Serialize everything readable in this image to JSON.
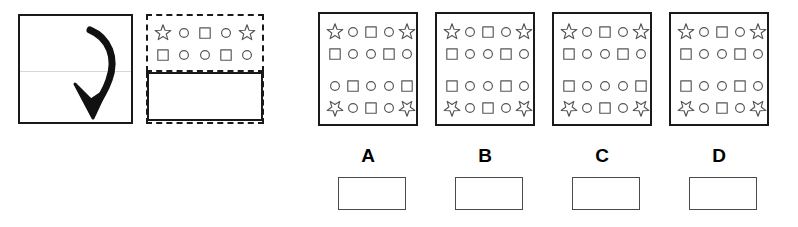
{
  "item": {
    "type": "paper-folding-reasoning-item",
    "shape_glyphs": {
      "star": "star-icon",
      "circle": "circle-icon",
      "square": "square-icon",
      "star_inverted": "star-inverted-icon",
      "blank": "blank-cell"
    }
  },
  "prompt": {
    "panel_1": {
      "name": "unfolded-sheet",
      "has_fold_line": true,
      "arrow": {
        "name": "fold-arrow-icon",
        "direction": "down-curved"
      }
    },
    "panel_2": {
      "name": "folded-sheet",
      "top_half": {
        "border_style": "dashed",
        "rows": [
          [
            "star",
            "circle",
            "square",
            "circle",
            "star"
          ],
          [
            "square",
            "circle",
            "circle",
            "square",
            "circle"
          ]
        ]
      },
      "bottom_half": {
        "border_style": "solid",
        "rows": []
      }
    }
  },
  "options": [
    {
      "label": "A",
      "name": "option-a",
      "rows": [
        [
          "star",
          "circle",
          "square",
          "circle",
          "star"
        ],
        [
          "square",
          "circle",
          "circle",
          "square",
          "circle"
        ],
        [
          "circle",
          "square",
          "circle",
          "circle",
          "square"
        ],
        [
          "star_inverted",
          "circle",
          "square",
          "circle",
          "star_inverted"
        ]
      ]
    },
    {
      "label": "B",
      "name": "option-b",
      "rows": [
        [
          "star",
          "circle",
          "square",
          "circle",
          "star"
        ],
        [
          "square",
          "circle",
          "circle",
          "square",
          "circle"
        ],
        [
          "square",
          "circle",
          "circle",
          "square",
          "circle"
        ],
        [
          "star_inverted",
          "circle",
          "square",
          "circle",
          "star_inverted"
        ]
      ]
    },
    {
      "label": "C",
      "name": "option-c",
      "rows": [
        [
          "star",
          "circle",
          "square",
          "circle",
          "star"
        ],
        [
          "square",
          "circle",
          "circle",
          "square",
          "circle"
        ],
        [
          "square",
          "circle",
          "circle",
          "circle",
          "square"
        ],
        [
          "star_inverted",
          "circle",
          "square",
          "circle",
          "star_inverted"
        ]
      ]
    },
    {
      "label": "D",
      "name": "option-d",
      "rows": [
        [
          "star",
          "circle",
          "square",
          "circle",
          "star"
        ],
        [
          "square",
          "circle",
          "circle",
          "square",
          "circle"
        ],
        [
          "square",
          "circle",
          "circle",
          "square",
          "circle"
        ],
        [
          "star_inverted",
          "circle",
          "square",
          "circle",
          "star_inverted"
        ]
      ]
    }
  ],
  "answer_boxes": [
    {
      "name": "answer-box-a",
      "value": ""
    },
    {
      "name": "answer-box-b",
      "value": ""
    },
    {
      "name": "answer-box-c",
      "value": ""
    },
    {
      "name": "answer-box-d",
      "value": ""
    }
  ],
  "colors": {
    "ink": "#1a1a1a",
    "shape_outline": "#555555",
    "fold_line": "#d8d8d8",
    "answer_box_border": "#4a4a4a",
    "background": "#ffffff"
  },
  "layout": {
    "prompt_panel_1": {
      "x": 18,
      "y": 14,
      "w": 115,
      "h": 110
    },
    "prompt_panel_2": {
      "x": 146,
      "y": 14,
      "w": 118,
      "h": 110
    },
    "prompt_panel_2_split_y": 58,
    "option_panels": [
      {
        "x": 318,
        "y": 12,
        "w": 100,
        "h": 114
      },
      {
        "x": 435,
        "y": 12,
        "w": 100,
        "h": 114
      },
      {
        "x": 552,
        "y": 12,
        "w": 100,
        "h": 114
      },
      {
        "x": 669,
        "y": 12,
        "w": 100,
        "h": 114
      }
    ],
    "option_label_y": 146,
    "answer_box": {
      "y": 177,
      "w": 68,
      "h": 33
    },
    "answer_box_x": [
      338,
      455,
      572,
      689
    ]
  }
}
